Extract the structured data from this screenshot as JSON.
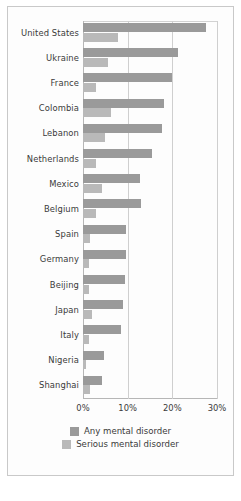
{
  "chart_data": {
    "type": "bar",
    "orientation": "horizontal",
    "title": "",
    "xlabel": "",
    "ylabel": "",
    "xlim": [
      0,
      30
    ],
    "xticks": [
      "0%",
      "10%",
      "20%",
      "30%"
    ],
    "xtick_values": [
      0,
      10,
      20,
      30
    ],
    "grid": true,
    "legend_position": "bottom",
    "categories": [
      "United States",
      "Ukraine",
      "France",
      "Colombia",
      "Lebanon",
      "Netherlands",
      "Mexico",
      "Belgium",
      "Spain",
      "Germany",
      "Beijing",
      "Japan",
      "Italy",
      "Nigeria",
      "Shanghai"
    ],
    "series": [
      {
        "name": "Any mental disorder",
        "color": "#9a9a9a",
        "values": [
          27.5,
          21.2,
          20.0,
          18.2,
          17.6,
          15.5,
          12.8,
          13.0,
          9.6,
          9.6,
          9.5,
          8.9,
          8.5,
          4.7,
          4.2
        ]
      },
      {
        "name": "Serious mental disorder",
        "color": "#b9b9b9",
        "values": [
          7.9,
          5.6,
          3.0,
          6.2,
          4.9,
          3.0,
          4.3,
          3.0,
          1.5,
          1.3,
          1.3,
          2.0,
          1.3,
          0.7,
          1.5
        ]
      }
    ]
  },
  "legend": {
    "items": [
      {
        "label": "Any mental disorder",
        "swatch": "any"
      },
      {
        "label": "Serious mental disorder",
        "swatch": "serious"
      }
    ]
  },
  "colors": {
    "any": "#9a9a9a",
    "serious": "#b9b9b9",
    "grid": "#cfcfcf",
    "axis": "#b6b6b6",
    "frame": "#c9c9c9",
    "text": "#3a3a3a"
  }
}
